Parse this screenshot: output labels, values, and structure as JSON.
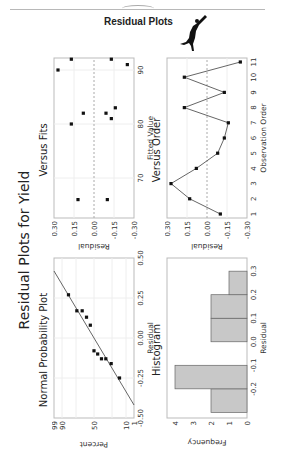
{
  "header": {
    "title": "Residual Plots",
    "logo_icon": "jumping-figure-icon"
  },
  "figure": {
    "title": "Residual Plots for Yield"
  },
  "panels": {
    "normal_probability": {
      "title": "Normal Probability Plot",
      "xlabel": "Residual",
      "ylabel": "Percent"
    },
    "versus_fits": {
      "title": "Versus Fits",
      "xlabel": "Fitted Value",
      "ylabel": "Residual"
    },
    "histogram": {
      "title": "Histogram",
      "xlabel": "Residual",
      "ylabel": "Frequency"
    },
    "versus_order": {
      "title": "Versus Order",
      "xlabel": "Observation Order",
      "ylabel": "Residual"
    }
  },
  "chart_data": [
    {
      "type": "scatter",
      "title": "Normal Probability Plot",
      "xlabel": "Residual",
      "ylabel": "Percent",
      "xlim": [
        -0.5,
        0.5
      ],
      "x_ticks": [
        "-0.50",
        "-0.25",
        "0.00",
        "0.25",
        "0.50"
      ],
      "y_ticks": [
        "1",
        "10",
        "50",
        "90",
        "99"
      ],
      "x": [
        -0.25,
        -0.16,
        -0.13,
        -0.13,
        -0.1,
        -0.08,
        0.08,
        0.13,
        0.17,
        0.17,
        0.27
      ],
      "y": [
        6.1,
        14.9,
        23.7,
        32.5,
        41.2,
        50.0,
        58.8,
        67.5,
        76.3,
        85.1,
        93.9
      ],
      "fit_line": {
        "x": [
          -0.42,
          0.42
        ],
        "y": [
          1,
          99
        ]
      },
      "grid": true
    },
    {
      "type": "scatter",
      "title": "Versus Fits",
      "xlabel": "Fitted Value",
      "ylabel": "Residual",
      "x_ticks": [
        "70",
        "80",
        "90"
      ],
      "y_ticks": [
        "0.30",
        "0.15",
        "0.00",
        "-0.15",
        "-0.30"
      ],
      "ylim": [
        -0.3,
        0.3
      ],
      "x": [
        66,
        66,
        80,
        81,
        82,
        82,
        83,
        90,
        91,
        92,
        92
      ],
      "y": [
        0.12,
        -0.1,
        0.17,
        -0.13,
        0.08,
        -0.09,
        -0.16,
        0.27,
        -0.25,
        0.17,
        -0.13
      ],
      "reference_line": 0.0,
      "grid": true
    },
    {
      "type": "bar",
      "title": "Histogram",
      "xlabel": "Residual",
      "ylabel": "Frequency",
      "categories": [
        "-0.2",
        "-0.1",
        "0.0",
        "0.1",
        "0.2",
        "0.3"
      ],
      "values": [
        2,
        4,
        0,
        2,
        2,
        1
      ],
      "y_ticks": [
        "0",
        "1",
        "2",
        "3",
        "4"
      ],
      "ylim": [
        0,
        4
      ],
      "grid": false
    },
    {
      "type": "line",
      "title": "Versus Order",
      "xlabel": "Observation Order",
      "ylabel": "Residual",
      "x": [
        1,
        2,
        3,
        4,
        5,
        6,
        7,
        8,
        9,
        10,
        11
      ],
      "y": [
        -0.1,
        0.13,
        0.27,
        0.08,
        -0.08,
        -0.13,
        -0.16,
        0.17,
        -0.13,
        0.17,
        -0.25
      ],
      "y_ticks": [
        "0.30",
        "0.15",
        "0.00",
        "-0.15",
        "-0.30"
      ],
      "ylim": [
        -0.3,
        0.3
      ],
      "reference_line": 0.0,
      "grid": true
    }
  ]
}
